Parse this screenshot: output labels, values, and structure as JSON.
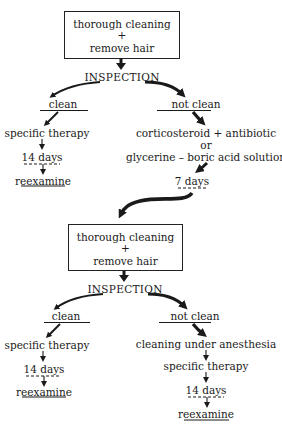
{
  "diagram": {
    "type": "flowchart",
    "stage1": {
      "box": {
        "line1": "thorough cleaning",
        "line2": "+",
        "line3": "remove hair"
      },
      "inspection": "INSPECTION",
      "clean_branch": {
        "label": "clean",
        "steps": [
          "specific therapy",
          "14 days",
          "reexamine"
        ]
      },
      "not_clean_branch": {
        "label": "not clean",
        "treatment_line1": "corticosteroid + antibiotic",
        "treatment_or": "or",
        "treatment_line2": "glycerine – boric acid solution",
        "wait": "7 days"
      }
    },
    "stage2": {
      "box": {
        "line1": "thorough cleaning",
        "line2": "+",
        "line3": "remove hair"
      },
      "inspection": "INSPECTION",
      "clean_branch": {
        "label": "clean",
        "steps": [
          "specific therapy",
          "14 days",
          "reexamine"
        ]
      },
      "not_clean_branch": {
        "label": "not clean",
        "steps": [
          "cleaning under anesthesia",
          "specific therapy",
          "14 days",
          "reexamine"
        ]
      }
    }
  }
}
